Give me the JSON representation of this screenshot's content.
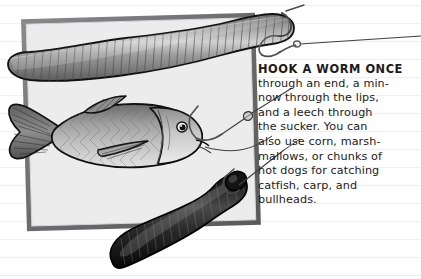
{
  "illustration": {
    "title": "Hooking live bait diagram",
    "background": {
      "type": "ruled-paper",
      "paper_color": "#fefefe",
      "rule_color": "#f1f1f1",
      "rule_spacing_px": 18
    },
    "frame": {
      "name": "picture-frame",
      "fill": "#e9e9e9",
      "border_color": "#6e6e70",
      "border_width_px": 5,
      "rotation_deg": -1.6
    },
    "subjects": [
      {
        "name": "earthworm",
        "label": "worm",
        "body_color": "#8a8a8a",
        "highlight_color": "#c9c9c9",
        "outline_color": "#141414",
        "segments": 46,
        "hooked": "through an end"
      },
      {
        "name": "minnow",
        "label": "minnow",
        "body_color": "#9a9a9a",
        "belly_color": "#dcdcdc",
        "outline_color": "#141414",
        "hooked": "through the lips"
      },
      {
        "name": "leech",
        "label": "leech",
        "body_color": "#1e1e1e",
        "highlight_color": "#5a5a5a",
        "outline_color": "#000000",
        "hooked": "through the sucker"
      }
    ],
    "tackle": {
      "hook_color": "#5c5c5c",
      "line_color": "#4a4a4a",
      "swivel_color": "#7d7d7d",
      "hook_count": 3
    }
  },
  "caption": {
    "heading": "HOOK A WORM ONCE",
    "lines": [
      "through an end, a min-",
      "now through the lips,",
      "and a leech through",
      "the sucker. You can",
      "also use corn, marsh-",
      "mallows, or chunks of",
      "hot dogs for catching",
      "catfish, carp, and",
      "bullheads."
    ]
  }
}
